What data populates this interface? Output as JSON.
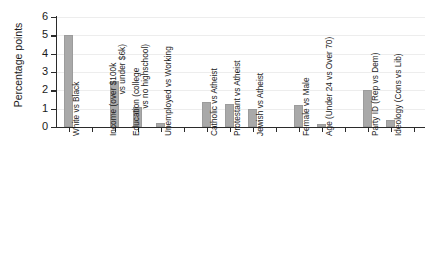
{
  "chart_data": {
    "type": "bar",
    "title": "",
    "xlabel": "",
    "ylabel": "Percentage points",
    "ylim": [
      0,
      6
    ],
    "yticks": [
      0,
      1,
      2,
      3,
      4,
      5,
      6
    ],
    "ytick_labels": [
      "0",
      "1",
      "2",
      "3",
      "4",
      "5",
      "6"
    ],
    "grid": true,
    "legend": false,
    "bar_color": "#a9a9a9",
    "axis_color": "#2b2b2b",
    "grid_color": "#ededed",
    "categories": [
      "White vs Black",
      "Income (over $100k vs under $6k)",
      "Education (college vs no highschool)",
      "Unemployed vs Working",
      "Catholic vs Atheist",
      "Protestant vs Atheist",
      "Jewish vs Atheist",
      "Female vs Male",
      "Age (Under 24 vs Over 70)",
      "Party ID (Rep vs Dem)",
      "Ideology (Cons vs Lib)"
    ],
    "category_lines": [
      [
        "White vs Black"
      ],
      [
        "Income (over $100k",
        "vs under $6k)"
      ],
      [
        "Education (college",
        "vs no highschool)"
      ],
      [
        "Unemployed vs Working"
      ],
      [
        "Catholic vs Atheist"
      ],
      [
        "Protestant vs Atheist"
      ],
      [
        "Jewish vs Atheist"
      ],
      [
        "Female vs Male"
      ],
      [
        "Age (Under 24 vs Over 70)"
      ],
      [
        "Party ID (Rep vs Dem)"
      ],
      [
        "Ideology (Cons vs Lib)"
      ]
    ],
    "values": [
      5.0,
      2.5,
      1.1,
      0.2,
      1.35,
      1.25,
      1.0,
      1.2,
      0.15,
      2.0,
      0.4
    ],
    "slots": [
      0,
      2,
      3,
      4,
      6,
      7,
      8,
      10,
      11,
      13,
      14
    ],
    "n_slots": 16
  }
}
